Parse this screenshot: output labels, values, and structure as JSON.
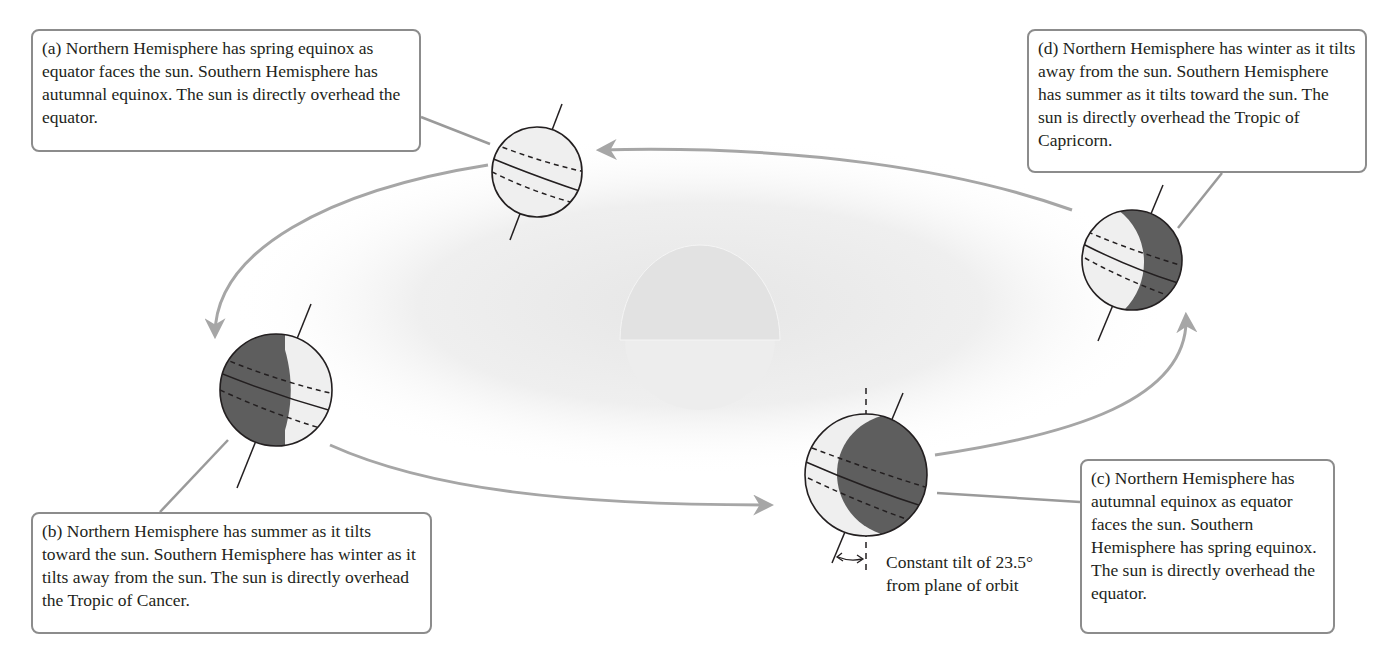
{
  "figure": {
    "colors": {
      "orbit_arrow": "#a6a6a6",
      "night_side": "#5e5e5e",
      "day_side": "#efefef",
      "sun": "#e4e4e4",
      "callout_border": "#8c8c8c",
      "text": "#231f20"
    }
  },
  "callouts": {
    "a": {
      "label": "(a)",
      "text": "(a) Northern Hemisphere has spring equinox as equator faces the sun. Southern Hemisphere has autumnal equinox. The sun is directly overhead the equator."
    },
    "b": {
      "label": "(b)",
      "text": "(b) Northern Hemisphere has summer as it tilts toward the sun. Southern Hemisphere has winter as it tilts away from the sun. The sun is directly overhead the Tropic of Cancer."
    },
    "c": {
      "label": "(c)",
      "text": "(c) Northern Hemisphere has autumnal equinox as equator faces the sun. Southern Hemisphere has spring equinox. The sun is directly overhead the equator."
    },
    "d": {
      "label": "(d)",
      "text": "(d) Northern Hemisphere has winter as it tilts away from the sun. Southern Hemisphere has summer as it tilts toward the sun. The sun is directly overhead the Tropic of Capricorn."
    }
  },
  "tilt_annotation": {
    "line1": "Constant tilt of 23.5°",
    "line2": "from plane of orbit",
    "angle_degrees": 23.5
  },
  "globes": [
    {
      "id": "a",
      "position": "top",
      "lit_fraction": "mostly lit, thin dark crescent on left"
    },
    {
      "id": "b",
      "position": "left",
      "lit_fraction": "mostly dark, lit crescent on right"
    },
    {
      "id": "c",
      "position": "bottom",
      "lit_fraction": "mostly dark, thin lit crescent on left"
    },
    {
      "id": "d",
      "position": "right",
      "lit_fraction": "half lit on left, dark on right"
    }
  ]
}
